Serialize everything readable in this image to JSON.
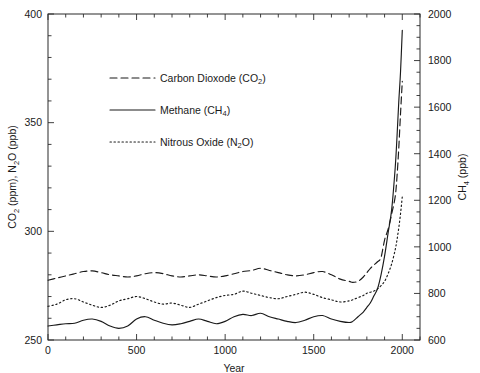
{
  "chart_data": {
    "type": "line",
    "title": "",
    "xlabel": "Year",
    "ylabel_left": "CO₂ (ppm), N₂O (ppb)",
    "ylabel_right": "CH₄ (ppb)",
    "xlim": [
      0,
      2100
    ],
    "ylim_left": [
      250,
      400
    ],
    "ylim_right": [
      600,
      2000
    ],
    "xticks_major": [
      0,
      500,
      1000,
      1500,
      2000
    ],
    "xticks_major_labels": [
      "0",
      "500",
      "1000",
      "1500",
      "2000"
    ],
    "xtick_step_minor": 100,
    "yticks_left_major": [
      250,
      300,
      350,
      400
    ],
    "yticks_left_major_labels": [
      "250",
      "300",
      "350",
      "400"
    ],
    "ytick_left_step_minor": 10,
    "yticks_right_major": [
      600,
      800,
      1000,
      1200,
      1400,
      1600,
      1800,
      2000
    ],
    "yticks_right_major_labels": [
      "600",
      "800",
      "1000",
      "1200",
      "1400",
      "1600",
      "1800",
      "2000"
    ],
    "ytick_right_step_minor": 50,
    "grid": false,
    "legend_position": "upper-center-left",
    "series": [
      {
        "name": "Carbon Dioxode (CO₂)",
        "axis": "left",
        "style": "dashed",
        "unit": "ppm",
        "x": [
          0,
          50,
          100,
          150,
          200,
          250,
          300,
          350,
          400,
          450,
          500,
          550,
          600,
          650,
          700,
          750,
          800,
          850,
          900,
          950,
          1000,
          1050,
          1100,
          1150,
          1200,
          1250,
          1300,
          1350,
          1400,
          1450,
          1500,
          1550,
          1600,
          1650,
          1700,
          1720,
          1750,
          1780,
          1800,
          1820,
          1840,
          1860,
          1880,
          1900,
          1920,
          1940,
          1960,
          1970,
          1980,
          1990,
          2000
        ],
        "y": [
          277.5,
          278.5,
          279.5,
          280.5,
          281.5,
          281.8,
          281.0,
          280.0,
          279.5,
          279.0,
          279.5,
          280.5,
          281.0,
          280.5,
          279.5,
          279.0,
          279.5,
          280.0,
          279.5,
          279.0,
          279.5,
          280.5,
          281.5,
          282.0,
          283.0,
          282.0,
          281.0,
          280.0,
          279.5,
          280.0,
          281.0,
          281.5,
          280.0,
          278.0,
          277.0,
          276.5,
          277.0,
          279.0,
          281.0,
          283.0,
          284.5,
          286.0,
          288.0,
          296.0,
          301.0,
          308.0,
          316.0,
          325.0,
          338.0,
          354.0,
          369.0
        ]
      },
      {
        "name": "Methane (CH₄)",
        "axis": "right",
        "style": "solid",
        "unit": "ppb",
        "x": [
          0,
          50,
          100,
          150,
          200,
          250,
          300,
          350,
          400,
          450,
          500,
          550,
          600,
          650,
          700,
          750,
          800,
          850,
          900,
          950,
          1000,
          1050,
          1100,
          1150,
          1200,
          1250,
          1300,
          1350,
          1400,
          1450,
          1500,
          1550,
          1600,
          1650,
          1700,
          1720,
          1750,
          1780,
          1800,
          1820,
          1840,
          1860,
          1880,
          1900,
          1920,
          1940,
          1960,
          1970,
          1980,
          1990,
          2000
        ],
        "y": [
          660,
          665,
          670,
          672,
          685,
          690,
          680,
          660,
          650,
          660,
          690,
          700,
          685,
          672,
          665,
          670,
          680,
          690,
          680,
          670,
          680,
          700,
          710,
          705,
          715,
          700,
          690,
          680,
          675,
          685,
          700,
          705,
          690,
          680,
          675,
          680,
          700,
          720,
          740,
          760,
          790,
          820,
          880,
          960,
          1060,
          1160,
          1340,
          1470,
          1620,
          1750,
          1930
        ]
      },
      {
        "name": "Nitrous Oxide (N₂O)",
        "axis": "left",
        "style": "dotted",
        "unit": "ppb",
        "x": [
          0,
          50,
          100,
          150,
          200,
          250,
          300,
          350,
          400,
          450,
          500,
          550,
          600,
          650,
          700,
          750,
          800,
          850,
          900,
          950,
          1000,
          1050,
          1100,
          1150,
          1200,
          1250,
          1300,
          1350,
          1400,
          1450,
          1500,
          1550,
          1600,
          1650,
          1700,
          1720,
          1750,
          1780,
          1800,
          1820,
          1840,
          1860,
          1880,
          1900,
          1920,
          1940,
          1960,
          1970,
          1980,
          1990,
          2000
        ],
        "y": [
          265.5,
          266.5,
          268.5,
          269.0,
          267.5,
          266.0,
          265.0,
          266.0,
          268.0,
          269.0,
          270.0,
          269.0,
          267.5,
          266.5,
          267.0,
          266.0,
          265.0,
          266.5,
          268.0,
          269.5,
          270.5,
          271.0,
          272.5,
          271.5,
          270.5,
          269.5,
          269.0,
          270.0,
          271.0,
          272.0,
          271.0,
          269.5,
          268.5,
          267.5,
          268.0,
          268.5,
          269.5,
          270.5,
          271.5,
          272.0,
          272.5,
          273.5,
          275.0,
          277.0,
          280.5,
          285.0,
          291.5,
          296.0,
          301.5,
          308.0,
          316.0
        ]
      }
    ]
  },
  "legend": {
    "entries": [
      {
        "label_main": "Carbon Dioxode (CO",
        "label_sub": "2",
        "label_tail": ")",
        "style": "dashed"
      },
      {
        "label_main": "Methane (CH",
        "label_sub": "4",
        "label_tail": ")",
        "style": "solid"
      },
      {
        "label_main": "Nitrous Oxide (N",
        "label_sub": "2",
        "label_tail": "O)",
        "style": "dotted"
      }
    ]
  },
  "axis_titles": {
    "x": "Year",
    "left_part1": "CO",
    "left_sub1": "2",
    "left_part2": " (ppm), N",
    "left_sub2": "2",
    "left_part3": "O (ppb)",
    "right_part1": "CH",
    "right_sub1": "4",
    "right_part2": " (ppb)"
  },
  "colors": {
    "line": "#1a1a1a",
    "frame": "#2b2b2b",
    "background": "#ffffff"
  }
}
